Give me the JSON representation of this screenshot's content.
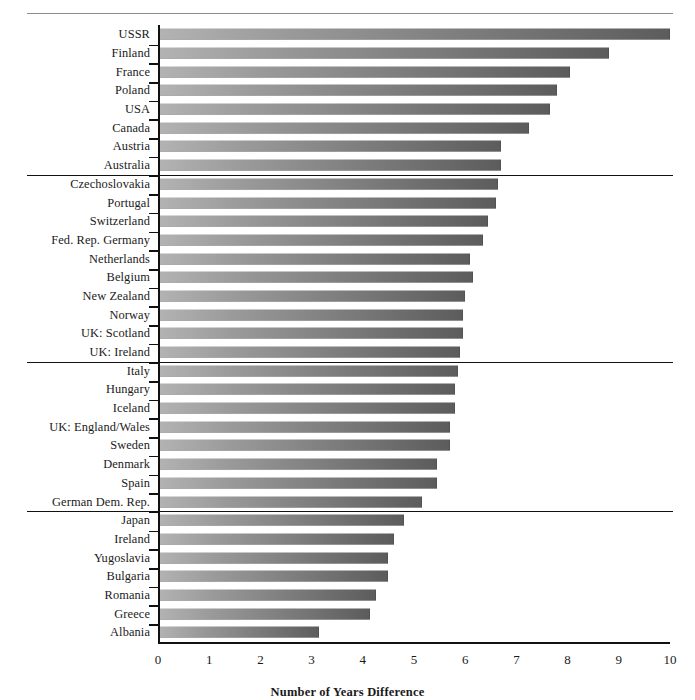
{
  "chart_data": {
    "type": "bar",
    "orientation": "horizontal",
    "title": "",
    "xlabel": "Number of Years Difference",
    "ylabel": "",
    "xlim": [
      0,
      10
    ],
    "xticks": [
      0,
      1,
      2,
      3,
      4,
      5,
      6,
      7,
      8,
      9,
      10
    ],
    "grid": false,
    "legend": null,
    "categories": [
      "USSR",
      "Finland",
      "France",
      "Poland",
      "USA",
      "Canada",
      "Austria",
      "Australia",
      "Czechoslovakia",
      "Portugal",
      "Switzerland",
      "Fed. Rep. Germany",
      "Netherlands",
      "Belgium",
      "New Zealand",
      "Norway",
      "UK: Scotland",
      "UK: Ireland",
      "Italy",
      "Hungary",
      "Iceland",
      "UK: England/Wales",
      "Sweden",
      "Denmark",
      "Spain",
      "German Dem. Rep.",
      "Japan",
      "Ireland",
      "Yugoslavia",
      "Bulgaria",
      "Romania",
      "Greece",
      "Albania"
    ],
    "values": [
      10.0,
      8.8,
      8.05,
      7.8,
      7.65,
      7.25,
      6.7,
      6.7,
      6.65,
      6.6,
      6.45,
      6.35,
      6.1,
      6.15,
      6.0,
      5.95,
      5.95,
      5.9,
      5.85,
      5.8,
      5.8,
      5.7,
      5.7,
      5.45,
      5.45,
      5.15,
      4.8,
      4.6,
      4.5,
      4.5,
      4.25,
      4.15,
      3.15
    ],
    "groups": [
      {
        "name": "group-1",
        "count": 8
      },
      {
        "name": "group-2",
        "count": 10
      },
      {
        "name": "group-3",
        "count": 8
      },
      {
        "name": "group-4",
        "count": 7
      }
    ],
    "bar_gradient": {
      "from": "#b3b3b3",
      "to": "#5c5c5c"
    },
    "axis_color": "#111111"
  }
}
